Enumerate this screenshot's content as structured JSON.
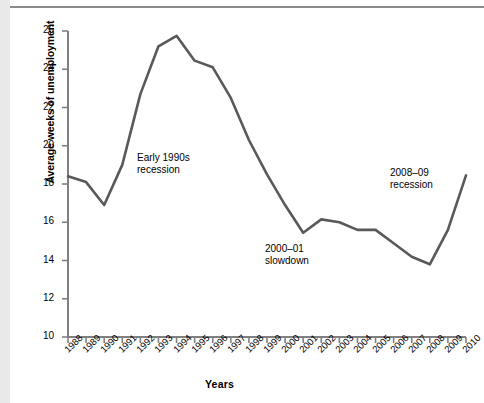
{
  "figure": {
    "background_color": "#ffffff",
    "line_color": "#595959",
    "axis_color": "#808080",
    "text_color": "#000000"
  },
  "chart_data": {
    "type": "line",
    "title": "",
    "xlabel": "Years",
    "ylabel": "Average weeks of unemployment",
    "xlim": [
      1988,
      2010
    ],
    "ylim": [
      10,
      26
    ],
    "grid": false,
    "legend": "none",
    "categories": [
      "1988",
      "1989",
      "1990",
      "1991",
      "1992",
      "1993",
      "1994",
      "1995",
      "1996",
      "1997",
      "1998",
      "1999",
      "2000",
      "2001",
      "2002",
      "2003",
      "2004",
      "2005",
      "2006",
      "2007",
      "2008",
      "2009",
      "2010"
    ],
    "values": [
      18.4,
      18.1,
      16.9,
      19.0,
      22.7,
      25.2,
      25.75,
      24.45,
      24.1,
      22.5,
      20.3,
      18.5,
      16.9,
      15.45,
      16.15,
      16.0,
      15.6,
      15.6,
      14.9,
      14.2,
      13.8,
      15.6,
      18.45
    ],
    "ytick_labels": [
      "26",
      "24",
      "22",
      "20",
      "18",
      "16",
      "14",
      "12",
      "10"
    ],
    "ytick_values": [
      26,
      24,
      22,
      20,
      18,
      16,
      14,
      12,
      10
    ],
    "xtick_labels": [
      "1988",
      "1989",
      "1990",
      "1991",
      "1992",
      "1993",
      "1994",
      "1995",
      "1996",
      "1997",
      "1998",
      "1999",
      "2000",
      "2001",
      "2002",
      "2003",
      "2004",
      "2005",
      "2006",
      "2007",
      "2008",
      "2009",
      "2010"
    ],
    "annotations": [
      {
        "id": "early-1990s-recession",
        "line1": "Early 1990s",
        "line2": "recession",
        "x": 137,
        "y": 152
      },
      {
        "id": "2000-01-slowdown",
        "line1": "2000–01",
        "line2": "slowdown",
        "x": 265,
        "y": 243
      },
      {
        "id": "2008-09-recession",
        "line1": "2008–09",
        "line2": "recession",
        "x": 390,
        "y": 167
      }
    ]
  }
}
